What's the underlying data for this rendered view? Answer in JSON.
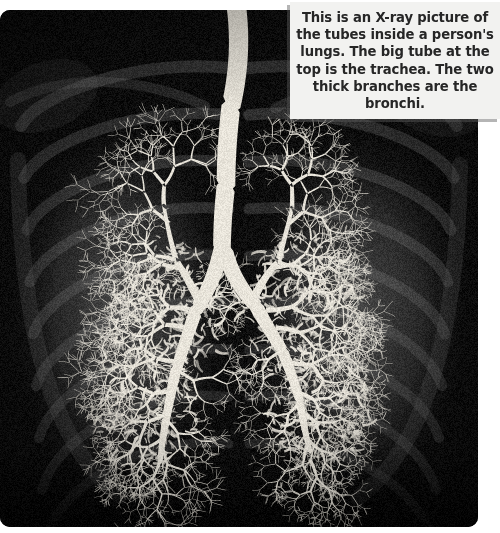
{
  "page": {
    "background_color": "#ffffff",
    "width": 500,
    "height": 533
  },
  "caption": {
    "text": "This is an X-ray picture of the tubes inside a person's lungs.  The big tube at the top is the trachea.  The two thick branches are the bronchi.",
    "background_color": "#f2f2f0",
    "text_color": "#262626",
    "shadow_color": "#5a5a5a"
  },
  "xray": {
    "alt": "Chest X-ray / bronchogram showing the trachea branching into the left and right bronchi and the bronchial trees of both lungs",
    "background_color": "#0d0d0d",
    "airway_color": "#e8e4da",
    "rib_color": "#3a3a3a",
    "corner_radius_px": 10,
    "anatomy": [
      {
        "name": "trachea",
        "label": "big tube at the top"
      },
      {
        "name": "carina",
        "label": "bifurcation point"
      },
      {
        "name": "left-main-bronchus",
        "label": "thick branch"
      },
      {
        "name": "right-main-bronchus",
        "label": "thick branch"
      },
      {
        "name": "left-bronchial-tree",
        "label": "branching airways of the left lung"
      },
      {
        "name": "right-bronchial-tree",
        "label": "branching airways of the right lung"
      },
      {
        "name": "rib-cage",
        "label": "faint ribs in the background"
      }
    ]
  }
}
